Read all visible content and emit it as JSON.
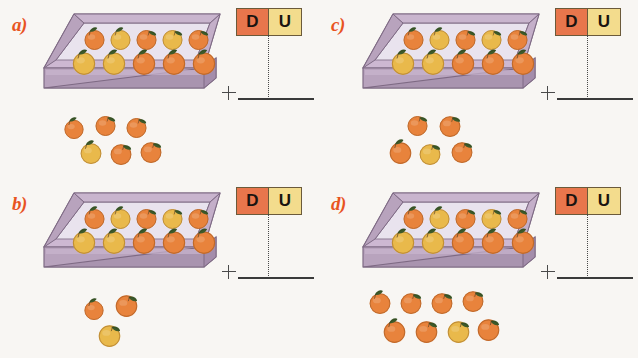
{
  "worksheet": {
    "background_color": "#f8f6f3",
    "label_color": "#e8541f",
    "crate_color": "#b8a3bd",
    "crate_rim_color": "#cdb8d2",
    "crate_floor_color": "#e9e3ee",
    "orange_color": "#e8833c",
    "orange_yellow_color": "#e9b94b",
    "leaf_color": "#3d5a2a",
    "d_cell_color": "#e8764c",
    "u_cell_color": "#f3dc8d",
    "line_color": "#3a3a3a"
  },
  "table_headers": {
    "tens": "D",
    "units": "U"
  },
  "operator": "+",
  "panels": [
    {
      "id": "a",
      "label": "a)",
      "crate_oranges": 10,
      "crate_rows": [
        5,
        5
      ],
      "loose_oranges": 6,
      "loose_rows": [
        3,
        3
      ],
      "total": 16,
      "tens_value": "",
      "units_value": "",
      "answer": ""
    },
    {
      "id": "b",
      "label": "b)",
      "crate_oranges": 10,
      "crate_rows": [
        5,
        5
      ],
      "loose_oranges": 3,
      "loose_rows": [
        2,
        1
      ],
      "total": 13,
      "tens_value": "",
      "units_value": "",
      "answer": ""
    },
    {
      "id": "c",
      "label": "c)",
      "crate_oranges": 10,
      "crate_rows": [
        5,
        5
      ],
      "loose_oranges": 5,
      "loose_rows": [
        2,
        3
      ],
      "total": 15,
      "tens_value": "",
      "units_value": "",
      "answer": ""
    },
    {
      "id": "d",
      "label": "d)",
      "crate_oranges": 10,
      "crate_rows": [
        5,
        5
      ],
      "loose_oranges": 8,
      "loose_rows": [
        4,
        4
      ],
      "total": 18,
      "tens_value": "",
      "units_value": "",
      "answer": ""
    }
  ],
  "icons": {
    "orange": "orange-fruit-icon",
    "leaf": "leaf-icon",
    "crate": "crate-box-icon",
    "plus": "plus-operator-icon"
  }
}
